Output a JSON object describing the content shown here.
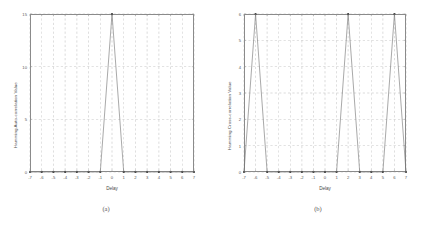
{
  "figure": {
    "background": "#ffffff",
    "line_color": "#6e6e6e",
    "grid_color": "#9a9a9a",
    "frame_color": "#8a8a8a",
    "marker_color": "#3a3a3a"
  },
  "subplots": [
    {
      "caption": "(a)",
      "xlabel": "Delay",
      "ylabel": "Hamming Auto-correlation Value",
      "xticks": [
        "-7",
        "-6",
        "-5",
        "-4",
        "-3",
        "-2",
        "-1",
        "0",
        "1",
        "2",
        "3",
        "4",
        "5",
        "6",
        "7"
      ],
      "yticks": [
        "0",
        "5",
        "10",
        "15"
      ]
    },
    {
      "caption": "(b)",
      "xlabel": "Delay",
      "ylabel": "Hamming Cross-correlation Value",
      "xticks": [
        "-7",
        "-6",
        "-5",
        "-4",
        "-3",
        "-2",
        "-1",
        "0",
        "1",
        "2",
        "3",
        "4",
        "5",
        "6",
        "7"
      ],
      "yticks": [
        "0",
        "1",
        "2",
        "3",
        "4",
        "5",
        "6"
      ]
    }
  ],
  "chart_data": [
    {
      "type": "line",
      "title": "",
      "subplot_label": "(a)",
      "xlabel": "Delay",
      "ylabel": "Hamming Auto-correlation Value",
      "x": [
        -7,
        -6,
        -5,
        -4,
        -3,
        -2,
        -1,
        0,
        1,
        2,
        3,
        4,
        5,
        6,
        7
      ],
      "values": [
        0,
        0,
        0,
        0,
        0,
        0,
        0,
        15,
        0,
        0,
        0,
        0,
        0,
        0,
        0
      ],
      "xlim": [
        -7,
        7
      ],
      "ylim": [
        0,
        15
      ],
      "xticks": [
        -7,
        -6,
        -5,
        -4,
        -3,
        -2,
        -1,
        0,
        1,
        2,
        3,
        4,
        5,
        6,
        7
      ],
      "yticks": [
        0,
        5,
        10,
        15
      ],
      "grid": true,
      "grid_style": "dashed",
      "legend": false,
      "markers": "dot"
    },
    {
      "type": "line",
      "title": "",
      "subplot_label": "(b)",
      "xlabel": "Delay",
      "ylabel": "Hamming Cross-correlation Value",
      "x": [
        -7,
        -6,
        -5,
        -4,
        -3,
        -2,
        -1,
        0,
        1,
        2,
        3,
        4,
        5,
        6,
        7
      ],
      "values": [
        0,
        6,
        0,
        0,
        0,
        0,
        0,
        0,
        0,
        6,
        0,
        0,
        0,
        6,
        0
      ],
      "xlim": [
        -7,
        7
      ],
      "ylim": [
        0,
        6
      ],
      "xticks": [
        -7,
        -6,
        -5,
        -4,
        -3,
        -2,
        -1,
        0,
        1,
        2,
        3,
        4,
        5,
        6,
        7
      ],
      "yticks": [
        0,
        1,
        2,
        3,
        4,
        5,
        6
      ],
      "grid": true,
      "grid_style": "dashed",
      "legend": false,
      "markers": "dot"
    }
  ]
}
